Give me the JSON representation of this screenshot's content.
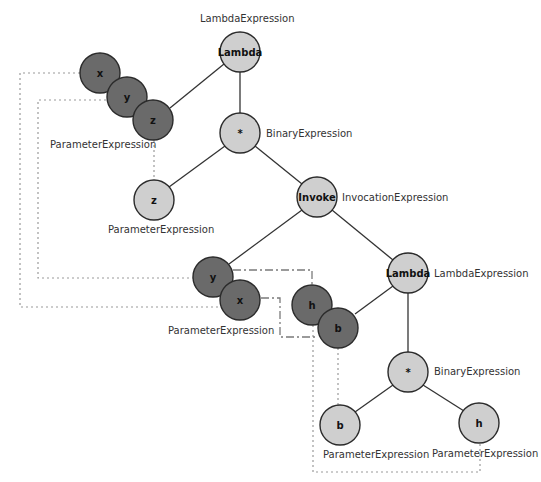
{
  "diagram": {
    "nodes": {
      "lambda1": {
        "label": "Lambda",
        "type": "LambdaExpression"
      },
      "param_x1": {
        "label": "x"
      },
      "param_y1": {
        "label": "y"
      },
      "param_z1": {
        "label": "z"
      },
      "params1_type": "ParameterExpression",
      "mul1": {
        "label": "*",
        "type": "BinaryExpression"
      },
      "z_param": {
        "label": "z",
        "type": "ParameterExpression"
      },
      "invoke": {
        "label": "Invoke",
        "type": "InvocationExpression"
      },
      "arg_y": {
        "label": "y"
      },
      "arg_x": {
        "label": "x"
      },
      "args_type": "ParameterExpression",
      "lambda2": {
        "label": "Lambda",
        "type": "LambdaExpression"
      },
      "param_h2": {
        "label": "h"
      },
      "param_b2": {
        "label": "b"
      },
      "mul2": {
        "label": "*",
        "type": "BinaryExpression"
      },
      "b_param": {
        "label": "b",
        "type": "ParameterExpression"
      },
      "h_param": {
        "label": "h",
        "type": "ParameterExpression"
      }
    },
    "colors": {
      "light_node": "#cfcfcf",
      "dark_node": "#6a6a6a",
      "edge": "#333333",
      "reference_line": "#9a9a9a"
    }
  }
}
